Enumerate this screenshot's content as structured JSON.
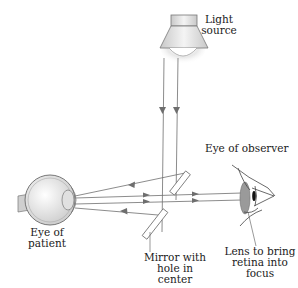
{
  "figure": {
    "type": "ophthalmoscope-principle-diagram",
    "labels": {
      "light_source": "Light\nsource",
      "eye_of_patient": "Eye of\npatient",
      "mirror": "Mirror with\nhole in center",
      "eye_of_observer": "Eye of observer",
      "lens": "Lens to bring\nretina into\nfocus"
    },
    "colors": {
      "line": "#6e6e6e",
      "lens_fill": "#9a9a9a",
      "mirror_fill": "#ffffff",
      "lamp_fill": "#dcdcdc",
      "eye_fill": "#e6e6e6",
      "text": "#1a1a1a"
    },
    "components": [
      {
        "name": "light-source",
        "kind": "lamp"
      },
      {
        "name": "eye-of-patient",
        "kind": "eyeball-cross-section"
      },
      {
        "name": "mirror-with-hole",
        "kind": "split-mirror"
      },
      {
        "name": "lens",
        "kind": "convex-lens"
      },
      {
        "name": "eye-of-observer",
        "kind": "eye-profile"
      }
    ]
  }
}
